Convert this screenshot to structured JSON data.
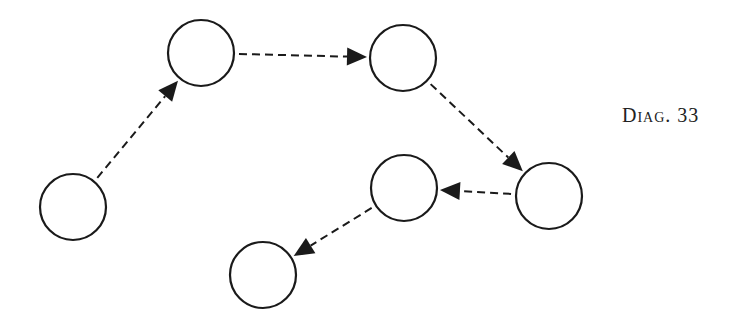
{
  "caption": {
    "label": "Diag. 33"
  },
  "style": {
    "stroke": "#1a1a1a",
    "fill": "#ffffff",
    "node_radius": 33
  },
  "nodes": [
    {
      "id": "n1",
      "cx": 73,
      "cy": 207
    },
    {
      "id": "n2",
      "cx": 201,
      "cy": 53
    },
    {
      "id": "n3",
      "cx": 403,
      "cy": 58
    },
    {
      "id": "n4",
      "cx": 549,
      "cy": 196
    },
    {
      "id": "n5",
      "cx": 404,
      "cy": 188
    },
    {
      "id": "n6",
      "cx": 263,
      "cy": 275
    }
  ],
  "edges": [
    {
      "from": "n1",
      "to": "n2",
      "style": "dashed",
      "arrow": "end"
    },
    {
      "from": "n2",
      "to": "n3",
      "style": "dashed",
      "arrow": "end"
    },
    {
      "from": "n3",
      "to": "n4",
      "style": "dashed",
      "arrow": "end"
    },
    {
      "from": "n4",
      "to": "n5",
      "style": "dashed",
      "arrow": "end"
    },
    {
      "from": "n5",
      "to": "n6",
      "style": "dashed",
      "arrow": "end"
    }
  ]
}
